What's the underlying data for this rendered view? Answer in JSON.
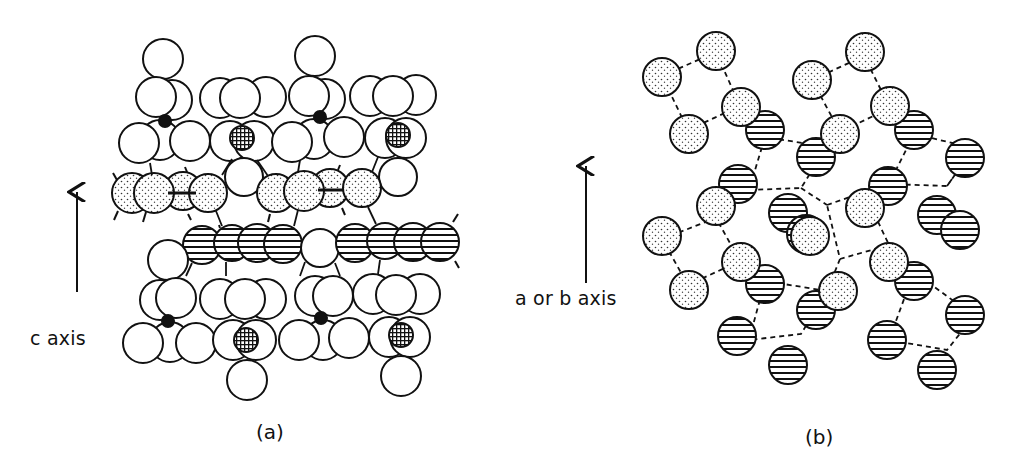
{
  "figure": {
    "panel_a": {
      "caption": "(a)",
      "axis_label": "c axis",
      "description": "Side view of layered crystal structure along c axis"
    },
    "panel_b": {
      "caption": "(b)",
      "axis_label": "a or b axis",
      "description": "Top view of hexagonal network of stippled and hatched atoms"
    },
    "legend_hints": {
      "open_circle": "plain atom",
      "stippled_circle": "stippled layer atom",
      "hatched_circle": "horizontally hatched layer atom",
      "crosshatched_circle": "cross-hatched small atom",
      "black_dot": "small filled atom"
    },
    "colors": {
      "stroke": "#111111",
      "background": "#ffffff"
    }
  }
}
